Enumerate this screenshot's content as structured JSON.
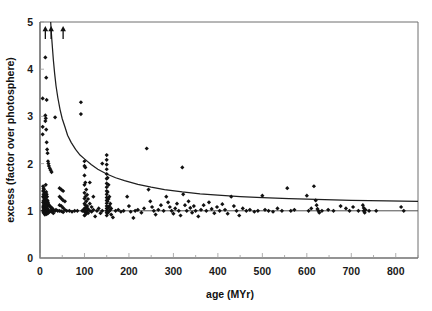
{
  "chart_data": {
    "type": "scatter",
    "title": "",
    "xlabel": "age (MYr)",
    "ylabel": "excess (factor over photosphere)",
    "xlim": [
      0,
      850
    ],
    "ylim": [
      0,
      5
    ],
    "xticks": [
      0,
      100,
      200,
      300,
      400,
      500,
      600,
      700,
      800
    ],
    "xticklabels": [
      "0",
      "100",
      "200",
      "300",
      "400",
      "500",
      "600",
      "700",
      "800"
    ],
    "xminor_step": 50,
    "yticks": [
      0,
      1,
      2,
      3,
      4,
      5
    ],
    "yticklabels": [
      "0",
      "1",
      "2",
      "3",
      "4",
      "5"
    ],
    "grid": false,
    "legend": null,
    "reference_lines": [
      {
        "name": "photosphere-unity-line",
        "orientation": "horizontal",
        "y": 1.0
      }
    ],
    "fit_curve": {
      "name": "decay-envelope",
      "description": "declining envelope, excess = 1.15 + 150/age",
      "points": [
        [
          24,
          5.0
        ],
        [
          26,
          4.7
        ],
        [
          28,
          4.45
        ],
        [
          30,
          4.2
        ],
        [
          33,
          3.9
        ],
        [
          36,
          3.65
        ],
        [
          40,
          3.4
        ],
        [
          45,
          3.15
        ],
        [
          50,
          2.95
        ],
        [
          56,
          2.78
        ],
        [
          62,
          2.6
        ],
        [
          70,
          2.45
        ],
        [
          80,
          2.3
        ],
        [
          90,
          2.18
        ],
        [
          100,
          2.1
        ],
        [
          115,
          1.98
        ],
        [
          130,
          1.88
        ],
        [
          150,
          1.78
        ],
        [
          170,
          1.7
        ],
        [
          190,
          1.64
        ],
        [
          220,
          1.56
        ],
        [
          250,
          1.5
        ],
        [
          280,
          1.45
        ],
        [
          320,
          1.4
        ],
        [
          360,
          1.36
        ],
        [
          400,
          1.33
        ],
        [
          450,
          1.3
        ],
        [
          500,
          1.28
        ],
        [
          560,
          1.26
        ],
        [
          620,
          1.24
        ],
        [
          700,
          1.22
        ],
        [
          780,
          1.21
        ],
        [
          850,
          1.2
        ]
      ]
    },
    "upper_limit_arrows": [
      {
        "x": 12,
        "y": 5.0
      },
      {
        "x": 25,
        "y": 5.0
      },
      {
        "x": 52,
        "y": 5.0
      }
    ],
    "points": [
      [
        6,
        3.38
      ],
      [
        6,
        2.78
      ],
      [
        6,
        2.62
      ],
      [
        7,
        1.52
      ],
      [
        7,
        1.42
      ],
      [
        7,
        1.3
      ],
      [
        7,
        1.18
      ],
      [
        7,
        1.08
      ],
      [
        7,
        1.0
      ],
      [
        8,
        1.48
      ],
      [
        8,
        1.35
      ],
      [
        8,
        1.22
      ],
      [
        8,
        1.12
      ],
      [
        8,
        1.04
      ],
      [
        8,
        0.96
      ],
      [
        9,
        1.45
      ],
      [
        9,
        1.28
      ],
      [
        9,
        1.15
      ],
      [
        9,
        1.06
      ],
      [
        9,
        0.98
      ],
      [
        10,
        1.38
      ],
      [
        10,
        1.26
      ],
      [
        10,
        1.1
      ],
      [
        10,
        1.02
      ],
      [
        10,
        0.94
      ],
      [
        11,
        1.33
      ],
      [
        11,
        1.2
      ],
      [
        11,
        1.07
      ],
      [
        11,
        1.0
      ],
      [
        11,
        0.92
      ],
      [
        12,
        4.25
      ],
      [
        12,
        3.02
      ],
      [
        12,
        2.9
      ],
      [
        12,
        1.3
      ],
      [
        12,
        1.15
      ],
      [
        12,
        1.03
      ],
      [
        12,
        0.97
      ],
      [
        13,
        2.96
      ],
      [
        13,
        1.55
      ],
      [
        13,
        1.25
      ],
      [
        13,
        1.12
      ],
      [
        13,
        1.0
      ],
      [
        14,
        3.82
      ],
      [
        14,
        2.72
      ],
      [
        14,
        1.4
      ],
      [
        14,
        1.18
      ],
      [
        14,
        1.05
      ],
      [
        14,
        0.98
      ],
      [
        15,
        3.35
      ],
      [
        15,
        2.45
      ],
      [
        15,
        1.35
      ],
      [
        15,
        1.1
      ],
      [
        15,
        1.0
      ],
      [
        15,
        0.93
      ],
      [
        16,
        2.3
      ],
      [
        16,
        1.3
      ],
      [
        16,
        1.08
      ],
      [
        16,
        1.0
      ],
      [
        17,
        2.22
      ],
      [
        17,
        1.22
      ],
      [
        17,
        1.04
      ],
      [
        17,
        0.96
      ],
      [
        18,
        2.05
      ],
      [
        18,
        1.18
      ],
      [
        18,
        1.02
      ],
      [
        18,
        0.95
      ],
      [
        19,
        2.0
      ],
      [
        19,
        1.14
      ],
      [
        19,
        1.0
      ],
      [
        20,
        1.95
      ],
      [
        20,
        1.12
      ],
      [
        20,
        0.99
      ],
      [
        22,
        1.9
      ],
      [
        22,
        1.1
      ],
      [
        22,
        0.98
      ],
      [
        24,
        1.86
      ],
      [
        24,
        1.08
      ],
      [
        24,
        1.0
      ],
      [
        26,
        1.82
      ],
      [
        26,
        1.05
      ],
      [
        28,
        1.05
      ],
      [
        28,
        0.97
      ],
      [
        30,
        1.02
      ],
      [
        30,
        0.95
      ],
      [
        34,
        2.98
      ],
      [
        34,
        1.0
      ],
      [
        36,
        1.02
      ],
      [
        40,
        1.0
      ],
      [
        44,
        1.48
      ],
      [
        44,
        1.3
      ],
      [
        44,
        1.12
      ],
      [
        44,
        1.0
      ],
      [
        48,
        1.45
      ],
      [
        48,
        1.26
      ],
      [
        48,
        1.1
      ],
      [
        48,
        0.99
      ],
      [
        52,
        1.42
      ],
      [
        52,
        1.22
      ],
      [
        52,
        1.06
      ],
      [
        52,
        0.97
      ],
      [
        56,
        1.2
      ],
      [
        56,
        1.02
      ],
      [
        60,
        1.0
      ],
      [
        66,
        1.0
      ],
      [
        72,
        0.98
      ],
      [
        78,
        1.0
      ],
      [
        84,
        1.0
      ],
      [
        92,
        3.3
      ],
      [
        92,
        3.05
      ],
      [
        95,
        1.0
      ],
      [
        98,
        1.02
      ],
      [
        100,
        2.05
      ],
      [
        100,
        1.95
      ],
      [
        100,
        1.75
      ],
      [
        100,
        1.55
      ],
      [
        100,
        1.38
      ],
      [
        100,
        1.26
      ],
      [
        100,
        1.15
      ],
      [
        100,
        1.05
      ],
      [
        100,
        0.98
      ],
      [
        100,
        0.9
      ],
      [
        102,
        1.92
      ],
      [
        102,
        1.6
      ],
      [
        102,
        1.3
      ],
      [
        102,
        1.12
      ],
      [
        102,
        1.0
      ],
      [
        102,
        0.92
      ],
      [
        104,
        1.45
      ],
      [
        104,
        1.2
      ],
      [
        104,
        1.06
      ],
      [
        104,
        0.96
      ],
      [
        106,
        1.34
      ],
      [
        106,
        1.1
      ],
      [
        106,
        1.0
      ],
      [
        108,
        1.25
      ],
      [
        108,
        1.04
      ],
      [
        108,
        0.95
      ],
      [
        112,
        1.6
      ],
      [
        112,
        1.15
      ],
      [
        112,
        1.0
      ],
      [
        116,
        1.08
      ],
      [
        116,
        0.98
      ],
      [
        120,
        1.3
      ],
      [
        120,
        1.02
      ],
      [
        124,
        0.88
      ],
      [
        128,
        1.0
      ],
      [
        132,
        1.05
      ],
      [
        136,
        0.95
      ],
      [
        140,
        2.0
      ],
      [
        140,
        1.0
      ],
      [
        150,
        2.18
      ],
      [
        150,
        2.08
      ],
      [
        150,
        1.98
      ],
      [
        150,
        1.88
      ],
      [
        150,
        1.78
      ],
      [
        150,
        1.68
      ],
      [
        150,
        1.58
      ],
      [
        150,
        1.5
      ],
      [
        150,
        1.42
      ],
      [
        150,
        1.35
      ],
      [
        150,
        1.28
      ],
      [
        150,
        1.22
      ],
      [
        150,
        1.16
      ],
      [
        150,
        1.1
      ],
      [
        150,
        1.05
      ],
      [
        150,
        1.0
      ],
      [
        150,
        0.96
      ],
      [
        150,
        0.9
      ],
      [
        152,
        1.7
      ],
      [
        152,
        1.4
      ],
      [
        152,
        1.2
      ],
      [
        152,
        1.05
      ],
      [
        152,
        0.95
      ],
      [
        154,
        1.55
      ],
      [
        154,
        1.25
      ],
      [
        154,
        1.08
      ],
      [
        154,
        0.98
      ],
      [
        156,
        1.3
      ],
      [
        156,
        1.1
      ],
      [
        156,
        1.0
      ],
      [
        158,
        1.15
      ],
      [
        158,
        1.02
      ],
      [
        160,
        1.05
      ],
      [
        160,
        0.92
      ],
      [
        164,
        0.86
      ],
      [
        170,
        1.0
      ],
      [
        176,
        1.02
      ],
      [
        182,
        0.98
      ],
      [
        188,
        1.0
      ],
      [
        196,
        1.3
      ],
      [
        200,
        1.1
      ],
      [
        204,
        0.98
      ],
      [
        210,
        0.85
      ],
      [
        214,
        1.0
      ],
      [
        220,
        1.02
      ],
      [
        228,
        0.96
      ],
      [
        234,
        1.05
      ],
      [
        240,
        2.32
      ],
      [
        244,
        1.45
      ],
      [
        248,
        1.2
      ],
      [
        252,
        1.08
      ],
      [
        256,
        1.0
      ],
      [
        260,
        0.92
      ],
      [
        266,
        1.02
      ],
      [
        272,
        1.12
      ],
      [
        278,
        1.0
      ],
      [
        284,
        1.3
      ],
      [
        288,
        1.18
      ],
      [
        292,
        1.08
      ],
      [
        296,
        1.0
      ],
      [
        300,
        0.94
      ],
      [
        304,
        1.05
      ],
      [
        308,
        1.15
      ],
      [
        312,
        1.0
      ],
      [
        316,
        0.9
      ],
      [
        320,
        1.92
      ],
      [
        322,
        1.35
      ],
      [
        326,
        1.12
      ],
      [
        330,
        1.0
      ],
      [
        334,
        1.2
      ],
      [
        338,
        1.06
      ],
      [
        342,
        0.96
      ],
      [
        346,
        1.1
      ],
      [
        350,
        1.0
      ],
      [
        356,
        0.88
      ],
      [
        362,
        1.02
      ],
      [
        368,
        1.12
      ],
      [
        374,
        1.0
      ],
      [
        380,
        1.18
      ],
      [
        386,
        1.04
      ],
      [
        392,
        0.95
      ],
      [
        398,
        1.08
      ],
      [
        404,
        1.0
      ],
      [
        410,
        1.14
      ],
      [
        416,
        1.02
      ],
      [
        422,
        0.94
      ],
      [
        430,
        1.3
      ],
      [
        436,
        1.1
      ],
      [
        442,
        1.0
      ],
      [
        448,
        0.9
      ],
      [
        456,
        1.05
      ],
      [
        464,
        1.0
      ],
      [
        472,
        1.02
      ],
      [
        482,
        0.98
      ],
      [
        490,
        1.0
      ],
      [
        500,
        1.32
      ],
      [
        506,
        1.02
      ],
      [
        514,
        1.0
      ],
      [
        524,
        0.98
      ],
      [
        534,
        1.05
      ],
      [
        544,
        1.0
      ],
      [
        556,
        1.48
      ],
      [
        564,
        1.0
      ],
      [
        572,
        1.02
      ],
      [
        600,
        1.32
      ],
      [
        604,
        1.0
      ],
      [
        610,
        1.05
      ],
      [
        616,
        1.52
      ],
      [
        620,
        1.22
      ],
      [
        622,
        1.12
      ],
      [
        624,
        1.04
      ],
      [
        626,
        1.0
      ],
      [
        628,
        0.96
      ],
      [
        634,
        1.0
      ],
      [
        648,
        1.02
      ],
      [
        660,
        1.0
      ],
      [
        676,
        1.1
      ],
      [
        688,
        1.05
      ],
      [
        696,
        1.0
      ],
      [
        704,
        1.08
      ],
      [
        716,
        1.0
      ],
      [
        726,
        1.12
      ],
      [
        728,
        1.06
      ],
      [
        728,
        1.0
      ],
      [
        730,
        0.96
      ],
      [
        732,
        1.02
      ],
      [
        740,
        1.0
      ],
      [
        756,
        1.0
      ],
      [
        812,
        1.08
      ],
      [
        818,
        1.0
      ]
    ]
  }
}
